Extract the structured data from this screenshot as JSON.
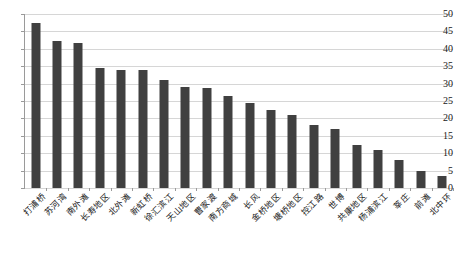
{
  "chart_data": {
    "type": "bar",
    "title": "",
    "subtitle": "",
    "xlabel": "",
    "ylabel": "",
    "ylim": [
      0,
      50
    ],
    "ytick_step": 5,
    "grid": true,
    "legend": false,
    "bar_color": "#404040",
    "gridline_color": "#d6d6d6",
    "axis_color": "#9a9a9a",
    "background_color": "#ffffff",
    "ytick_labels": [
      "0",
      "5",
      "10",
      "15",
      "20",
      "25",
      "30",
      "35",
      "40",
      "45",
      "50"
    ],
    "ytick_values": [
      0,
      5,
      10,
      15,
      20,
      25,
      30,
      35,
      40,
      45,
      50
    ],
    "categories": [
      "打浦桥",
      "苏河湾",
      "南外滩",
      "长寿地区",
      "北外滩",
      "新虹桥",
      "徐汇滨江",
      "天山地区",
      "曹家渡",
      "南方商城",
      "长风",
      "金桥地区",
      "塘桥地区",
      "控江路",
      "世博",
      "共康地区",
      "杨浦滨江",
      "莘庄",
      "前滩",
      "北中环"
    ],
    "values": [
      47.5,
      42.3,
      41.8,
      34.5,
      34.0,
      34.0,
      31.0,
      29.0,
      28.8,
      26.3,
      24.5,
      22.5,
      21.0,
      18.0,
      17.0,
      12.5,
      11.0,
      8.0,
      5.0,
      3.5
    ]
  }
}
